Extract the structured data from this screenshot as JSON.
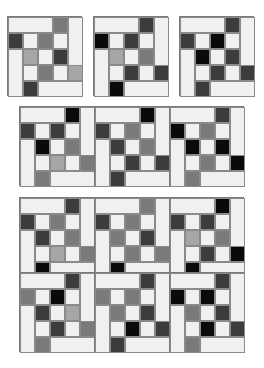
{
  "diagram": {
    "title": "",
    "shades": {
      "L": "#f0f0f0",
      "G": "#a6a6a6",
      "M": "#7a7a7a",
      "D": "#3c3c3c",
      "K": "#0a0a0a"
    },
    "blocks": [
      {
        "x": 7,
        "y": 16,
        "grid": [
          [
            "L",
            "L",
            "L",
            "M",
            "L"
          ],
          [
            "D",
            "L",
            "M",
            "L",
            "L"
          ],
          [
            "L",
            "G",
            "L",
            "D",
            "L"
          ],
          [
            "L",
            "L",
            "M",
            "L",
            "G"
          ],
          [
            "L",
            "D",
            "L",
            "L",
            "L"
          ]
        ]
      },
      {
        "x": 93,
        "y": 16,
        "grid": [
          [
            "L",
            "L",
            "L",
            "D",
            "L"
          ],
          [
            "K",
            "L",
            "D",
            "L",
            "L"
          ],
          [
            "L",
            "G",
            "L",
            "M",
            "L"
          ],
          [
            "L",
            "L",
            "D",
            "L",
            "D"
          ],
          [
            "L",
            "K",
            "L",
            "L",
            "L"
          ]
        ]
      },
      {
        "x": 179,
        "y": 16,
        "grid": [
          [
            "L",
            "L",
            "L",
            "D",
            "L"
          ],
          [
            "D",
            "L",
            "K",
            "L",
            "L"
          ],
          [
            "L",
            "K",
            "L",
            "D",
            "L"
          ],
          [
            "L",
            "L",
            "D",
            "L",
            "D"
          ],
          [
            "L",
            "D",
            "L",
            "L",
            "L"
          ]
        ]
      },
      {
        "x": 19,
        "y": 106,
        "grid": [
          [
            "L",
            "L",
            "L",
            "K",
            "L"
          ],
          [
            "D",
            "L",
            "D",
            "L",
            "L"
          ],
          [
            "L",
            "K",
            "L",
            "M",
            "L"
          ],
          [
            "L",
            "L",
            "G",
            "L",
            "M"
          ],
          [
            "L",
            "M",
            "L",
            "L",
            "L"
          ]
        ]
      },
      {
        "x": 94,
        "y": 106,
        "grid": [
          [
            "L",
            "L",
            "L",
            "K",
            "L"
          ],
          [
            "D",
            "L",
            "M",
            "L",
            "L"
          ],
          [
            "L",
            "D",
            "L",
            "M",
            "L"
          ],
          [
            "L",
            "L",
            "D",
            "L",
            "D"
          ],
          [
            "L",
            "D",
            "L",
            "L",
            "L"
          ]
        ]
      },
      {
        "x": 169,
        "y": 106,
        "grid": [
          [
            "L",
            "L",
            "L",
            "D",
            "L"
          ],
          [
            "K",
            "L",
            "M",
            "L",
            "L"
          ],
          [
            "L",
            "K",
            "L",
            "K",
            "L"
          ],
          [
            "L",
            "L",
            "M",
            "L",
            "K"
          ],
          [
            "L",
            "M",
            "L",
            "L",
            "L"
          ]
        ]
      },
      {
        "x": 19,
        "y": 197,
        "grid": [
          [
            "L",
            "L",
            "L",
            "D",
            "L"
          ],
          [
            "D",
            "L",
            "M",
            "L",
            "L"
          ],
          [
            "L",
            "D",
            "L",
            "M",
            "L"
          ],
          [
            "L",
            "L",
            "G",
            "L",
            "M"
          ],
          [
            "L",
            "K",
            "L",
            "L",
            "L"
          ]
        ]
      },
      {
        "x": 94,
        "y": 197,
        "grid": [
          [
            "L",
            "L",
            "L",
            "M",
            "L"
          ],
          [
            "D",
            "L",
            "M",
            "L",
            "L"
          ],
          [
            "L",
            "M",
            "L",
            "D",
            "L"
          ],
          [
            "L",
            "L",
            "M",
            "L",
            "M"
          ],
          [
            "L",
            "K",
            "L",
            "L",
            "L"
          ]
        ]
      },
      {
        "x": 169,
        "y": 197,
        "grid": [
          [
            "L",
            "L",
            "L",
            "K",
            "L"
          ],
          [
            "D",
            "L",
            "D",
            "L",
            "L"
          ],
          [
            "L",
            "G",
            "L",
            "M",
            "L"
          ],
          [
            "L",
            "L",
            "D",
            "L",
            "K"
          ],
          [
            "L",
            "K",
            "L",
            "L",
            "L"
          ]
        ]
      },
      {
        "x": 19,
        "y": 272,
        "grid": [
          [
            "L",
            "L",
            "L",
            "D",
            "L"
          ],
          [
            "M",
            "L",
            "K",
            "L",
            "L"
          ],
          [
            "L",
            "D",
            "L",
            "G",
            "L"
          ],
          [
            "L",
            "L",
            "D",
            "L",
            "M"
          ],
          [
            "L",
            "M",
            "L",
            "L",
            "L"
          ]
        ]
      },
      {
        "x": 94,
        "y": 272,
        "grid": [
          [
            "L",
            "L",
            "L",
            "D",
            "L"
          ],
          [
            "M",
            "L",
            "M",
            "L",
            "L"
          ],
          [
            "L",
            "M",
            "L",
            "D",
            "L"
          ],
          [
            "L",
            "L",
            "K",
            "L",
            "D"
          ],
          [
            "L",
            "D",
            "L",
            "L",
            "L"
          ]
        ]
      },
      {
        "x": 169,
        "y": 272,
        "grid": [
          [
            "L",
            "L",
            "L",
            "D",
            "L"
          ],
          [
            "K",
            "L",
            "K",
            "L",
            "L"
          ],
          [
            "L",
            "M",
            "L",
            "D",
            "L"
          ],
          [
            "L",
            "L",
            "K",
            "L",
            "D"
          ],
          [
            "L",
            "M",
            "L",
            "L",
            "L"
          ]
        ]
      }
    ]
  }
}
